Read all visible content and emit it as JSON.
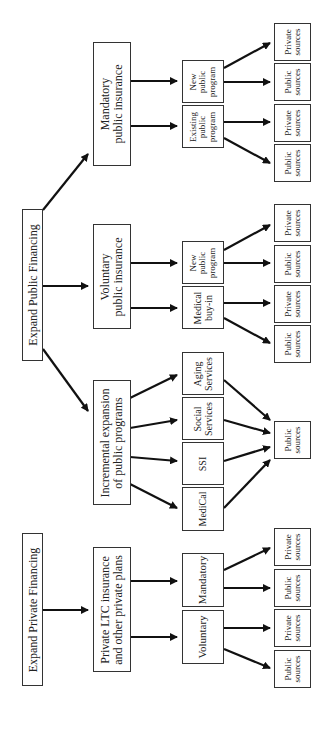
{
  "diagram": {
    "orientation": "rotated 90 degrees counter-clockwise",
    "roots": {
      "private": "Expand Private Financing",
      "public": "Expand Public Financing"
    },
    "level2": {
      "private_plans": "Private LTC insurance\nand other private plans",
      "incremental": "Incremental expansion\nof public programs",
      "voluntary_public": "Voluntary\npublic insurance",
      "mandatory_public": "Mandatory\npublic insurance"
    },
    "level3": {
      "voluntary": "Voluntary",
      "mandatory": "Mandatory",
      "medical": "MediCal",
      "ssi": "SSI",
      "social": "Social\nServices",
      "aging": "Aging\nServices",
      "buyin": "Medical\nbuy-in",
      "new_public_1": "New\npublic\nprogram",
      "existing_public": "Existing\npublic\nprogram",
      "new_public_2": "New\npublic\nprogram"
    },
    "level4": {
      "public_sources": "Public\nsources",
      "private_sources": "Private\nsources"
    }
  }
}
